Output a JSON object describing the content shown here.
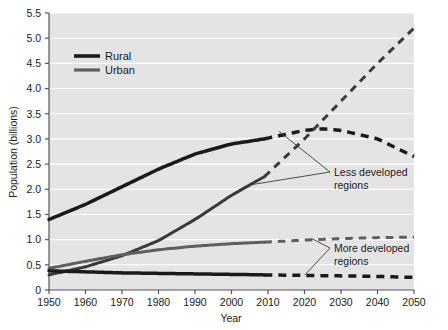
{
  "chart_data": {
    "type": "line",
    "title": "",
    "xlabel": "Year",
    "ylabel": "Population (billions)",
    "xlim": [
      1950,
      2050
    ],
    "ylim": [
      0,
      5.5
    ],
    "xticks": [
      1950,
      1960,
      1970,
      1980,
      1990,
      2000,
      2010,
      2020,
      2030,
      2040,
      2050
    ],
    "yticks": [
      "0",
      "0.5",
      "1.0",
      "1.5",
      "2.0",
      "2.5",
      "3.0",
      "3.5",
      "4.0",
      "4.5",
      "5.0",
      "5.5"
    ],
    "grid": "horizontal-white",
    "legend": {
      "position": "top-left-inside",
      "entries": [
        {
          "label": "Rural",
          "color": "#1a1a1a"
        },
        {
          "label": "Urban",
          "color": "#5e5e5e"
        }
      ]
    },
    "projection_starts_year": 2009,
    "series": [
      {
        "name": "Less developed regions - Rural",
        "group": "Less developed regions",
        "type": "Rural",
        "color": "#1a1a1a",
        "x": [
          1950,
          1960,
          1970,
          1980,
          1990,
          2000,
          2009,
          2020,
          2025,
          2030,
          2040,
          2050
        ],
        "values": [
          1.4,
          1.7,
          2.05,
          2.4,
          2.7,
          2.9,
          3.0,
          3.17,
          3.2,
          3.17,
          3.0,
          2.65
        ]
      },
      {
        "name": "Less developed regions - Urban",
        "group": "Less developed regions",
        "type": "Urban",
        "color": "#3a3a3a",
        "x": [
          1950,
          1960,
          1970,
          1980,
          1990,
          2000,
          2009,
          2020,
          2030,
          2040,
          2050
        ],
        "values": [
          0.3,
          0.46,
          0.68,
          0.98,
          1.4,
          1.88,
          2.25,
          3.0,
          3.75,
          4.5,
          5.2
        ]
      },
      {
        "name": "More developed regions - Urban",
        "group": "More developed regions",
        "type": "Urban",
        "color": "#5e5e5e",
        "x": [
          1950,
          1960,
          1970,
          1980,
          1990,
          2000,
          2009,
          2020,
          2030,
          2040,
          2050
        ],
        "values": [
          0.43,
          0.57,
          0.7,
          0.8,
          0.87,
          0.92,
          0.95,
          0.99,
          1.02,
          1.04,
          1.05
        ]
      },
      {
        "name": "More developed regions - Rural",
        "group": "More developed regions",
        "type": "Rural",
        "color": "#1a1a1a",
        "x": [
          1950,
          1960,
          1970,
          1980,
          1990,
          2000,
          2009,
          2020,
          2030,
          2040,
          2050
        ],
        "values": [
          0.38,
          0.36,
          0.34,
          0.33,
          0.32,
          0.31,
          0.3,
          0.29,
          0.28,
          0.27,
          0.25
        ]
      }
    ],
    "annotations": [
      {
        "id": "less-developed",
        "text_line1": "Less developed",
        "text_line2": "regions",
        "points_to": [
          "Less developed regions - Rural",
          "Less developed regions - Urban"
        ]
      },
      {
        "id": "more-developed",
        "text_line1": "More developed",
        "text_line2": "regions",
        "points_to": [
          "More developed regions - Urban",
          "More developed regions - Rural"
        ]
      }
    ],
    "colors": {
      "plot_background": "#e4e4e4",
      "gridline": "#ffffff",
      "axis": "#555555",
      "page_background": "#ffffff",
      "text": "#1a1a1a"
    }
  }
}
